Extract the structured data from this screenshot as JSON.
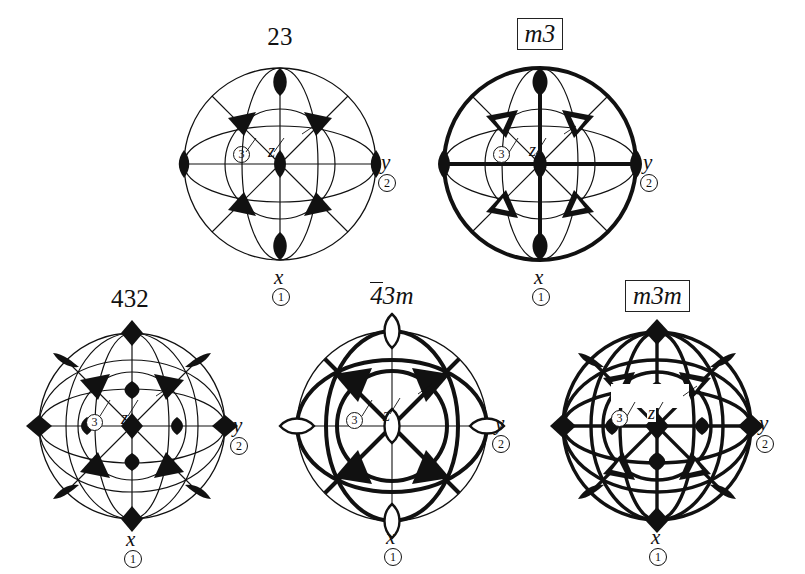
{
  "figure": {
    "kind": "stereographic-projection-set",
    "background_color": "#ffffff",
    "ink_color": "#111111"
  },
  "symbols": {
    "two_fold_filled": "filled-lens",
    "three_fold_filled": "filled-triangle",
    "three_fold_open": "filled-triangle-with-white-center",
    "four_fold_filled": "filled-diamond",
    "four_fold_bar_open": "open-lens-pointed",
    "mirror_plane": "bold-great-circle"
  },
  "diagrams": [
    {
      "id": "23",
      "title": "23",
      "title_style": "plain",
      "boxed": false,
      "overbar": false,
      "centrosymmetric": false,
      "has_mirrors": false,
      "primary_axis_symbol": "filled-lens",
      "triad_symbol": "filled-triangle",
      "labels": {
        "z": "z",
        "triad": "3",
        "y": "y",
        "y_order": "2",
        "x": "x",
        "x_order": "1"
      }
    },
    {
      "id": "m3",
      "title": "m3",
      "title_style": "italic",
      "boxed": true,
      "overbar": false,
      "centrosymmetric": true,
      "has_mirrors": true,
      "primary_axis_symbol": "filled-lens",
      "triad_symbol": "filled-triangle-with-white-center",
      "labels": {
        "z": "z",
        "triad": "3",
        "y": "y",
        "y_order": "2",
        "x": "x",
        "x_order": "1"
      }
    },
    {
      "id": "432",
      "title": "432",
      "title_style": "plain",
      "boxed": false,
      "overbar": false,
      "centrosymmetric": false,
      "has_mirrors": false,
      "primary_axis_symbol": "filled-diamond",
      "triad_symbol": "filled-triangle",
      "labels": {
        "z": "z",
        "triad": "3",
        "y": "y",
        "y_order": "2",
        "x": "x",
        "x_order": "1"
      }
    },
    {
      "id": "-43m",
      "title": "43m",
      "title_prefix": "4",
      "title_suffix": "3m",
      "title_style": "italic-m",
      "boxed": false,
      "overbar": true,
      "centrosymmetric": false,
      "has_mirrors": true,
      "primary_axis_symbol": "open-lens-pointed",
      "triad_symbol": "filled-triangle",
      "labels": {
        "z": "z",
        "triad": "3",
        "y": "y",
        "y_order": "2",
        "x": "x",
        "x_order": "1"
      }
    },
    {
      "id": "m3m",
      "title": "m3m",
      "title_style": "italic",
      "boxed": true,
      "overbar": false,
      "centrosymmetric": true,
      "has_mirrors": true,
      "primary_axis_symbol": "filled-diamond",
      "triad_symbol": "filled-triangle-with-white-center",
      "labels": {
        "z": "z",
        "triad": "3",
        "y": "y",
        "y_order": "2",
        "x": "x",
        "x_order": "1"
      }
    }
  ]
}
